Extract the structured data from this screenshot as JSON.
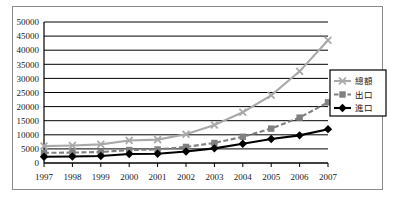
{
  "chart_data": {
    "type": "line",
    "title": "",
    "xlabel": "",
    "ylabel": "",
    "categories": [
      "1997",
      "1998",
      "1999",
      "2000",
      "2001",
      "2002",
      "2003",
      "2004",
      "2005",
      "2006",
      "2007"
    ],
    "ylim": [
      0,
      50000
    ],
    "ytick_step": 5000,
    "yticks": [
      "0",
      "5000",
      "10000",
      "15000",
      "20000",
      "25000",
      "30000",
      "35000",
      "40000",
      "45000",
      "50000"
    ],
    "grid": true,
    "legend_position": "right",
    "series": [
      {
        "name": "總額",
        "color": "#a9a9a9",
        "marker": "x",
        "dash": "solid",
        "values": [
          6000,
          6200,
          6600,
          8000,
          8300,
          10200,
          13500,
          18000,
          24000,
          32500,
          43500
        ]
      },
      {
        "name": "出口",
        "color": "#808080",
        "marker": "square",
        "dash": "dashed",
        "values": [
          3600,
          3700,
          3900,
          4600,
          4800,
          5700,
          7100,
          9300,
          12200,
          16100,
          21500
        ]
      },
      {
        "name": "進口",
        "color": "#000000",
        "marker": "diamond",
        "dash": "solid",
        "values": [
          2200,
          2300,
          2500,
          3200,
          3300,
          4100,
          5200,
          6800,
          8500,
          9800,
          12000
        ]
      }
    ]
  },
  "legend": {
    "items": [
      {
        "label": "總額"
      },
      {
        "label": "出口"
      },
      {
        "label": "進口"
      }
    ]
  }
}
